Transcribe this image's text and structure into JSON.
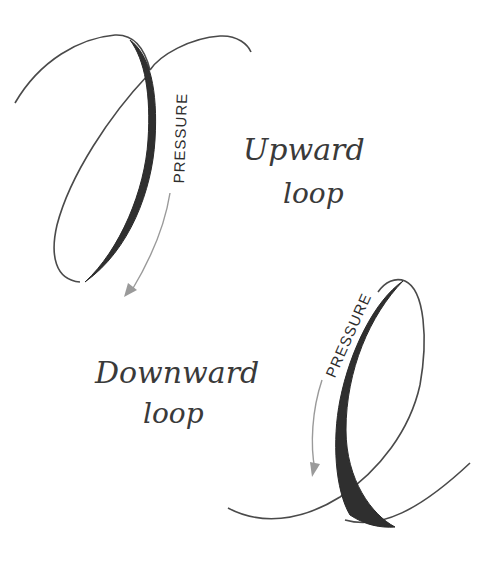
{
  "diagram": {
    "upward_loop": {
      "pressure_label": "PRESSURE",
      "caption_line1": "Upward",
      "caption_line2": "loop"
    },
    "downward_loop": {
      "pressure_label": "PRESSURE",
      "caption_line1": "Downward",
      "caption_line2": "loop"
    },
    "colors": {
      "stroke": "#4a4a4a",
      "shaded_stroke": "#2a2a2a",
      "arrow": "#9a9a9a",
      "background": "#ffffff"
    }
  }
}
